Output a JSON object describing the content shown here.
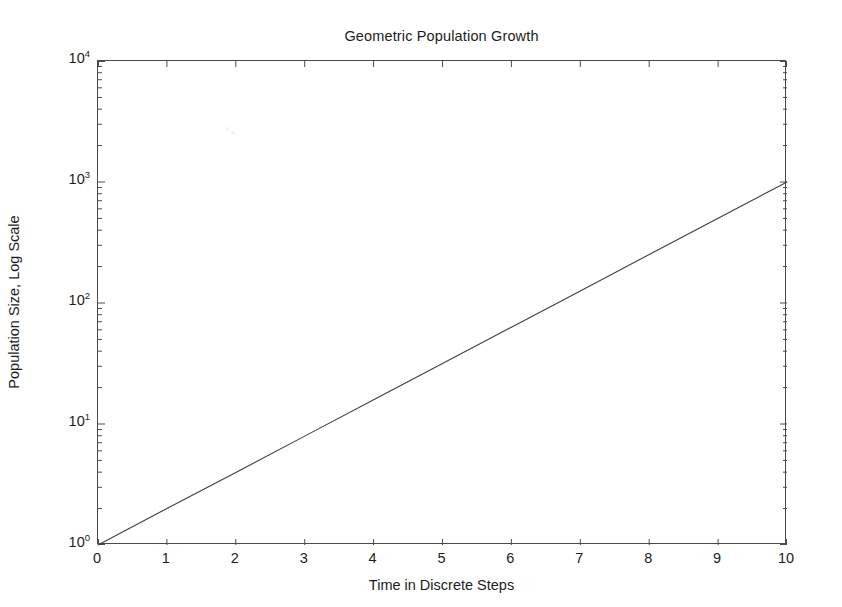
{
  "chart_data": {
    "type": "line",
    "title": "Geometric Population Growth",
    "xlabel": "Time in Discrete Steps",
    "ylabel": "Population Size, Log Scale",
    "yscale": "log",
    "xscale": "linear",
    "xlim": [
      0,
      10
    ],
    "ylim": [
      1,
      10000
    ],
    "grid": false,
    "legend": null,
    "x": [
      0,
      1,
      2,
      3,
      4,
      5,
      6,
      7,
      8,
      9,
      10
    ],
    "values": [
      1,
      2,
      3.98,
      7.94,
      15.85,
      31.62,
      63.1,
      125.89,
      251.19,
      501.19,
      1000
    ],
    "series": [
      {
        "name": "Population",
        "color": "#3f3f3f",
        "values": [
          1,
          2,
          3.98,
          7.94,
          15.85,
          31.62,
          63.1,
          125.89,
          251.19,
          501.19,
          1000
        ]
      }
    ],
    "xticks": [
      {
        "value": 0,
        "label": "0"
      },
      {
        "value": 1,
        "label": "1"
      },
      {
        "value": 2,
        "label": "2"
      },
      {
        "value": 3,
        "label": "3"
      },
      {
        "value": 4,
        "label": "4"
      },
      {
        "value": 5,
        "label": "5"
      },
      {
        "value": 6,
        "label": "6"
      },
      {
        "value": 7,
        "label": "7"
      },
      {
        "value": 8,
        "label": "8"
      },
      {
        "value": 9,
        "label": "9"
      },
      {
        "value": 10,
        "label": "10"
      }
    ],
    "yticks": [
      {
        "value": 10000,
        "base": "10",
        "exponent": "4"
      },
      {
        "value": 1000,
        "base": "10",
        "exponent": "3"
      },
      {
        "value": 100,
        "base": "10",
        "exponent": "2"
      },
      {
        "value": 10,
        "base": "10",
        "exponent": "1"
      },
      {
        "value": 1,
        "base": "10",
        "exponent": "0"
      }
    ],
    "minor_tick_mantissas": [
      2,
      3,
      4,
      5,
      6,
      7,
      8,
      9
    ],
    "axis_color": "#4a4a4a",
    "background_color": "#ffffff"
  }
}
